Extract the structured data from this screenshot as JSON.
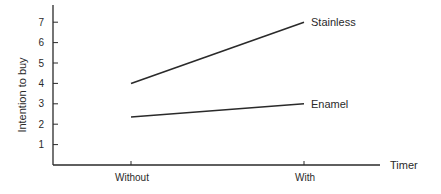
{
  "chart_data": {
    "type": "line",
    "title": "",
    "xlabel": "Timer",
    "ylabel": "Intention to buy",
    "categories": [
      "Without",
      "With"
    ],
    "series": [
      {
        "name": "Stainless",
        "values": [
          4.0,
          7.0
        ]
      },
      {
        "name": "Enamel",
        "values": [
          2.35,
          3.0
        ]
      }
    ],
    "yticks": [
      1,
      2,
      3,
      4,
      5,
      6,
      7
    ],
    "ylim": [
      0,
      8
    ],
    "grid": false,
    "legend": "direct labels at line ends (right)"
  },
  "colors": {
    "line": "#2a2a2a",
    "axis": "#2a2a2a",
    "background": "#ffffff"
  }
}
